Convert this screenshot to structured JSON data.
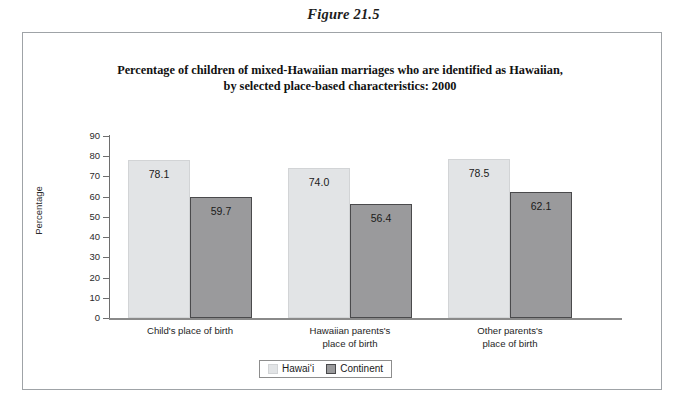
{
  "figure_caption": "Figure 21.5",
  "chart_data": {
    "type": "bar",
    "title_line1": "Percentage of children of mixed-Hawaiian marriages who are identified as Hawaiian,",
    "title_line2": "by selected place-based characteristics: 2000",
    "xlabel": "",
    "ylabel": "Percentage",
    "ylim": [
      0,
      90
    ],
    "y_ticks": [
      "90",
      "80",
      "70",
      "60",
      "50",
      "40",
      "30",
      "20",
      "10",
      "0"
    ],
    "grid": false,
    "legend_position": "bottom-center",
    "categories": [
      "Child's place of birth",
      "Hawaiian parents's\nplace of birth",
      "Other parents's\nplace of birth"
    ],
    "categories_lines": [
      [
        "Child's place of birth"
      ],
      [
        "Hawaiian parents's",
        "place of birth"
      ],
      [
        "Other parents's",
        "place of birth"
      ]
    ],
    "series": [
      {
        "name": "Hawaiʻi",
        "color": "#e2e4e6",
        "values": [
          78.1,
          74.0,
          78.5
        ]
      },
      {
        "name": "Continent",
        "color": "#9a9a9c",
        "values": [
          59.7,
          56.4,
          62.1
        ]
      }
    ],
    "value_labels": [
      [
        "78.1",
        "59.7"
      ],
      [
        "74.0",
        "56.4"
      ],
      [
        "78.5",
        "62.1"
      ]
    ]
  },
  "colors": {
    "series_light": "#e2e4e6",
    "series_dark": "#9a9a9c",
    "frame_border": "#9fa3a7",
    "axis": "#6e6e6e"
  }
}
